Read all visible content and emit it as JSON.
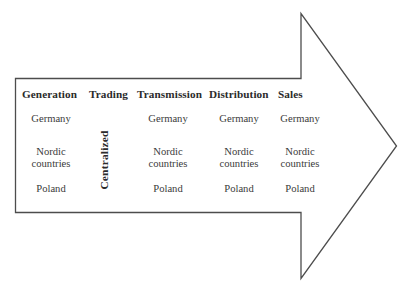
{
  "diagram": {
    "shape": "right-arrow",
    "stroke_color": "#4d4d4d",
    "fill_color": "#ffffff",
    "columns": [
      {
        "id": "generation",
        "header": "Generation",
        "entries": [
          "Germany",
          "Nordic countries",
          "Poland"
        ]
      },
      {
        "id": "trading",
        "header": "Trading",
        "vertical_label": "Centralized",
        "entries": []
      },
      {
        "id": "transmission",
        "header": "Transmission",
        "entries": [
          "Germany",
          "Nordic countries",
          "Poland"
        ]
      },
      {
        "id": "distribution",
        "header": "Distribution",
        "entries": [
          "Germany",
          "Nordic countries",
          "Poland"
        ]
      },
      {
        "id": "sales",
        "header": "Sales",
        "entries": [
          "Germany",
          "Nordic countries",
          "Poland"
        ]
      }
    ]
  }
}
